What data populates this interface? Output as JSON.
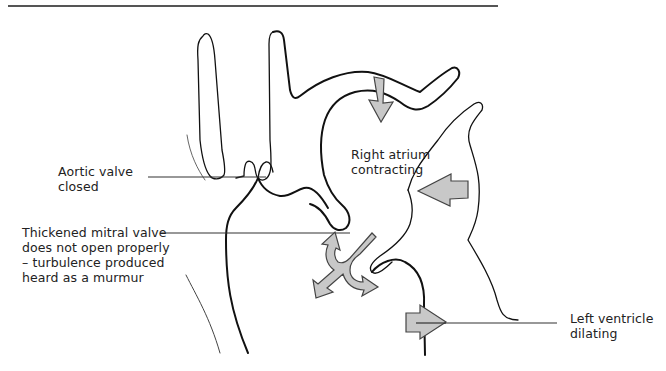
{
  "figure": {
    "colors": {
      "outline": "#111111",
      "arrow_fill": "#c8c8c8",
      "arrow_stroke": "#444444",
      "leader_line": "#333333",
      "rule": "#555555"
    }
  },
  "labels": {
    "aortic_valve": [
      "Aortic valve",
      "closed"
    ],
    "mitral_valve": [
      "Thickened mitral valve",
      "does not open properly",
      "– turbulence produced",
      "heard as a murmur"
    ],
    "right_atrium": [
      "Right atrium",
      "contracting"
    ],
    "left_ventricle": [
      "Left ventricle",
      "dilating"
    ]
  },
  "arrows": [
    {
      "id": "atrium-top-arrow",
      "meaning": "right atrium contracting inward",
      "direction": "down"
    },
    {
      "id": "atrium-side-arrow",
      "meaning": "right atrium contracting inward",
      "direction": "left"
    },
    {
      "id": "mitral-turbulence-arrow",
      "meaning": "turbulent flow through mitral valve",
      "direction": "split"
    },
    {
      "id": "ventricle-arrow",
      "meaning": "left ventricle dilating outward",
      "direction": "right"
    }
  ]
}
